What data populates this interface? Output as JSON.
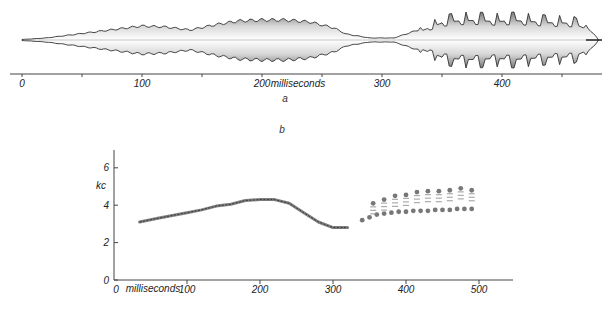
{
  "figure": {
    "panel_a_label": "a",
    "panel_b_label": "b"
  },
  "chart_data": [
    {
      "type": "area",
      "title": "",
      "panel": "a",
      "description": "Oscillogram (amplitude envelope) of a sound over time",
      "xlabel": "milliseconds",
      "ylabel": "",
      "xlim": [
        0,
        480
      ],
      "x_ticks": [
        0,
        100,
        200,
        300,
        400
      ],
      "x_tick_labels": [
        "0",
        "100",
        "200",
        "300",
        "400"
      ],
      "x_minor_ticks": [
        50,
        150,
        250,
        350,
        450
      ],
      "grid": false,
      "envelope": {
        "x": [
          0,
          20,
          40,
          60,
          80,
          100,
          120,
          140,
          160,
          180,
          200,
          220,
          240,
          260,
          270,
          290,
          310,
          320,
          330,
          340,
          350,
          360,
          370,
          380,
          390,
          400,
          410,
          420,
          430,
          440,
          450,
          460,
          470,
          475,
          480
        ],
        "half_amplitude": [
          0.5,
          2,
          5,
          8,
          11,
          14,
          13,
          10,
          15,
          19,
          20,
          20,
          18,
          12,
          6,
          2,
          2,
          6,
          10,
          16,
          22,
          24,
          25,
          25,
          24,
          24,
          25,
          24,
          23,
          22,
          22,
          21,
          14,
          8,
          1
        ]
      }
    },
    {
      "type": "scatter",
      "title": "",
      "panel": "b",
      "description": "Sound spectrogram trace: frequency (kc) vs time",
      "xlabel": "milliseconds",
      "ylabel": "kc",
      "xlim": [
        0,
        550
      ],
      "ylim": [
        0,
        7
      ],
      "x_ticks": [
        0,
        100,
        200,
        300,
        400,
        500
      ],
      "x_tick_labels": [
        "0",
        "100",
        "200",
        "300",
        "400",
        "500"
      ],
      "y_ticks": [
        0,
        2,
        4,
        6
      ],
      "y_tick_labels": [
        "0",
        "2",
        "4",
        "6"
      ],
      "grid": false,
      "series": [
        {
          "name": "fundamental sweep",
          "x": [
            35,
            60,
            80,
            100,
            120,
            140,
            160,
            180,
            200,
            220,
            240,
            260,
            280,
            300,
            320
          ],
          "y": [
            3.1,
            3.3,
            3.45,
            3.6,
            3.75,
            3.95,
            4.05,
            4.25,
            4.3,
            4.3,
            4.1,
            3.6,
            3.1,
            2.8,
            2.8
          ]
        },
        {
          "name": "pulsed component (lower band)",
          "x": [
            340,
            350,
            360,
            370,
            380,
            390,
            400,
            410,
            420,
            430,
            440,
            450,
            460,
            470,
            480,
            490
          ],
          "y": [
            3.2,
            3.35,
            3.5,
            3.55,
            3.6,
            3.65,
            3.65,
            3.7,
            3.7,
            3.7,
            3.75,
            3.75,
            3.75,
            3.8,
            3.8,
            3.8
          ]
        },
        {
          "name": "pulsed component (upper band)",
          "x": [
            355,
            370,
            385,
            400,
            415,
            430,
            445,
            460,
            475,
            490
          ],
          "y": [
            4.1,
            4.3,
            4.5,
            4.55,
            4.7,
            4.75,
            4.75,
            4.8,
            4.9,
            4.8
          ]
        }
      ]
    }
  ]
}
